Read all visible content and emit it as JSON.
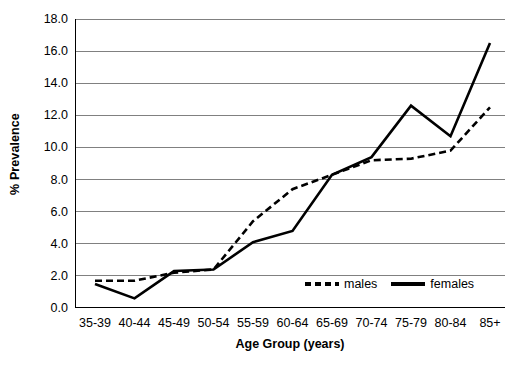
{
  "chart_data": {
    "type": "line",
    "title": "",
    "xlabel": "Age Group (years)",
    "ylabel": "% Prevalence",
    "categories": [
      "35-39",
      "40-44",
      "45-49",
      "50-54",
      "55-59",
      "60-64",
      "65-69",
      "70-74",
      "75-79",
      "80-84",
      "85+"
    ],
    "series": [
      {
        "name": "males",
        "style": "dashed",
        "color": "#000000",
        "values": [
          1.7,
          1.7,
          2.2,
          2.4,
          5.4,
          7.4,
          8.3,
          9.2,
          9.3,
          9.8,
          12.5
        ]
      },
      {
        "name": "females",
        "style": "solid",
        "color": "#000000",
        "values": [
          1.5,
          0.6,
          2.3,
          2.4,
          4.1,
          4.8,
          8.3,
          9.4,
          12.6,
          10.7,
          16.5
        ]
      }
    ],
    "ylim": [
      0.0,
      18.0
    ],
    "ytick_values": [
      0.0,
      2.0,
      4.0,
      6.0,
      8.0,
      10.0,
      12.0,
      14.0,
      16.0,
      18.0
    ],
    "ytick_labels": [
      "0.0",
      "2.0",
      "4.0",
      "6.0",
      "8.0",
      "10.0",
      "12.0",
      "14.0",
      "16.0",
      "18.0"
    ],
    "grid": "horizontal",
    "legend_position": "inside-bottom-right",
    "axis_color": "#000000",
    "grid_color": "#808080",
    "background": "#ffffff"
  },
  "legend": {
    "items": [
      {
        "label": "males",
        "style": "dashed"
      },
      {
        "label": "females",
        "style": "solid"
      }
    ]
  }
}
